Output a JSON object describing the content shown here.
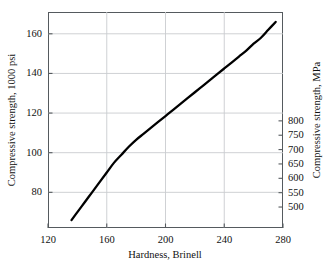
{
  "chart_data": {
    "type": "line",
    "title": "",
    "subtitle": "",
    "xlabel": "Hardness, Brinell",
    "ylabel": "Compressive strength, 1000 psi",
    "y2label": "Compressive strength, MPa",
    "xlim": [
      120,
      280
    ],
    "ylim": [
      62,
      171
    ],
    "y2lim": [
      427,
      1179
    ],
    "grid": true,
    "legend": null,
    "xticks": [
      120,
      160,
      200,
      240,
      280
    ],
    "xtick_labels": [
      "120",
      "160",
      "200",
      "240",
      "280"
    ],
    "yticks": [
      80,
      100,
      120,
      140,
      160
    ],
    "ytick_labels": [
      "80",
      "100",
      "120",
      "140",
      "160"
    ],
    "y2ticks": [
      500,
      550,
      600,
      650,
      700,
      750,
      800
    ],
    "y2tick_labels": [
      "500",
      "550",
      "600",
      "650",
      "700",
      "750",
      "800"
    ],
    "series": [
      {
        "name": "compressive-strength-vs-hardness",
        "color": "#000000",
        "x": [
          136,
          140,
          145,
          150,
          155,
          160,
          165,
          170,
          175,
          180,
          185,
          190,
          195,
          200,
          205,
          210,
          215,
          220,
          225,
          230,
          235,
          240,
          245,
          250,
          255,
          260,
          265,
          270,
          275
        ],
        "y": [
          66,
          70,
          75,
          80,
          85,
          90,
          95,
          99,
          103,
          106.5,
          109.5,
          112.5,
          115.5,
          118.5,
          121.5,
          124.5,
          127.5,
          130.5,
          133.5,
          136.5,
          139.5,
          142.5,
          145.5,
          148.5,
          151.5,
          155,
          158,
          162,
          166
        ],
        "y2": [
          455,
          483,
          517,
          552,
          586,
          621,
          655,
          683,
          710,
          734,
          755,
          776,
          797,
          817,
          838,
          859,
          879,
          900,
          921,
          941,
          962,
          983,
          1003,
          1024,
          1045,
          1069,
          1089,
          1117,
          1145
        ]
      }
    ]
  },
  "axes": {
    "left": {
      "title": "Compressive strength, 1000 psi"
    },
    "right": {
      "title": "Compressive strength, MPa"
    },
    "bottom": {
      "title": "Hardness, Brinell"
    }
  },
  "colors": {
    "curve": "#000000",
    "frame": "#555a5e",
    "grid": "#c9cccf",
    "text": "#111111",
    "background": "#ffffff"
  }
}
